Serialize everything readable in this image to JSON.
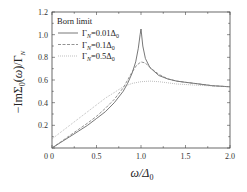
{
  "chart_data": {
    "type": "line",
    "title": "",
    "xlabel": "ω/Δ0",
    "ylabel": "−ImΣ0(ω)/ΓN",
    "xlim": [
      0,
      2.0
    ],
    "ylim": [
      0,
      1.2
    ],
    "grid": false,
    "legend_position": "upper-left",
    "legend_title": "Born limit",
    "xticks": [
      "0",
      "0.5",
      "1.0",
      "1.5",
      "2.0"
    ],
    "yticks": [
      "0.2",
      "0.4",
      "0.6",
      "0.8",
      "1.0",
      "1.2"
    ],
    "x_origin_label": "0",
    "series": [
      {
        "name": "ΓN=0.01Δ0",
        "style": "solid",
        "color": "#555555",
        "x": [
          0,
          0.1,
          0.2,
          0.3,
          0.4,
          0.5,
          0.6,
          0.7,
          0.8,
          0.85,
          0.9,
          0.94,
          0.97,
          0.99,
          1.0,
          1.02,
          1.05,
          1.1,
          1.2,
          1.3,
          1.4,
          1.5,
          1.6,
          1.8,
          2.0
        ],
        "y": [
          0,
          0.05,
          0.1,
          0.15,
          0.2,
          0.26,
          0.32,
          0.4,
          0.5,
          0.57,
          0.66,
          0.76,
          0.88,
          1.0,
          1.05,
          0.9,
          0.79,
          0.71,
          0.64,
          0.61,
          0.59,
          0.58,
          0.57,
          0.55,
          0.54
        ]
      },
      {
        "name": "ΓN=0.1Δ0",
        "style": "dashed",
        "color": "#777777",
        "x": [
          0,
          0.1,
          0.2,
          0.3,
          0.4,
          0.5,
          0.6,
          0.7,
          0.8,
          0.85,
          0.9,
          0.95,
          1.0,
          1.05,
          1.1,
          1.2,
          1.3,
          1.4,
          1.5,
          1.6,
          1.8,
          2.0
        ],
        "y": [
          0,
          0.055,
          0.11,
          0.165,
          0.22,
          0.28,
          0.35,
          0.43,
          0.53,
          0.6,
          0.67,
          0.73,
          0.76,
          0.75,
          0.71,
          0.65,
          0.61,
          0.59,
          0.58,
          0.57,
          0.55,
          0.54
        ]
      },
      {
        "name": "ΓN=0.5Δ0",
        "style": "dotted",
        "color": "#999999",
        "x": [
          0,
          0.1,
          0.2,
          0.3,
          0.4,
          0.5,
          0.6,
          0.7,
          0.8,
          0.9,
          1.0,
          1.1,
          1.2,
          1.3,
          1.4,
          1.5,
          1.6,
          1.8,
          2.0
        ],
        "y": [
          0.08,
          0.14,
          0.2,
          0.26,
          0.32,
          0.38,
          0.44,
          0.49,
          0.54,
          0.57,
          0.585,
          0.59,
          0.585,
          0.575,
          0.565,
          0.56,
          0.555,
          0.548,
          0.542
        ]
      }
    ]
  }
}
